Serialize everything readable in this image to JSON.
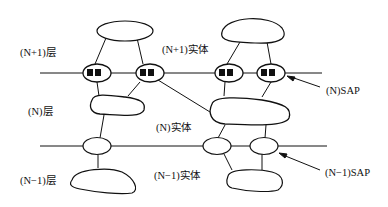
{
  "diagram": {
    "layers": [
      {
        "label": "(N+1)层"
      },
      {
        "label": "(N)层"
      },
      {
        "label": "(N−1)层"
      }
    ],
    "entities": [
      {
        "label": "(N+1)实体"
      },
      {
        "label": "(N)实体"
      },
      {
        "label": "(N−1)实体"
      }
    ],
    "sap_labels": [
      {
        "label": "(N)SAP"
      },
      {
        "label": "(N−1)SAP"
      }
    ]
  }
}
